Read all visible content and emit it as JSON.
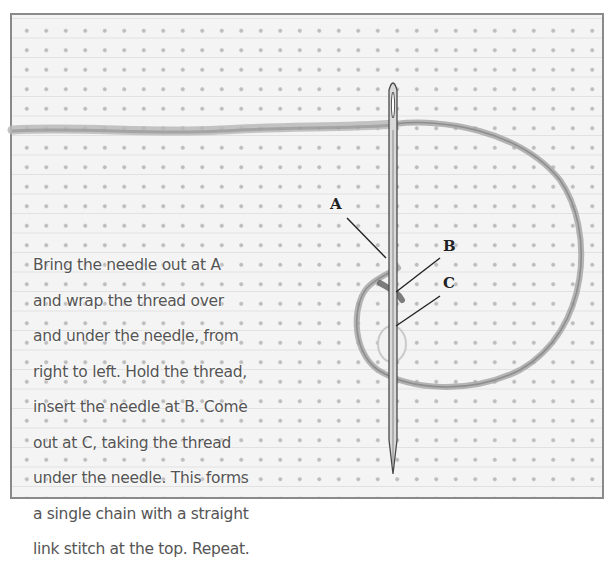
{
  "diagram": {
    "type": "embroidery-stitch-instruction",
    "instructions": {
      "lines": [
        "Bring the needle out at A",
        "and wrap the thread over",
        "and under the needle, from",
        "right to left. Hold the thread,",
        "insert the needle at B. Come",
        "out at C, taking the thread",
        "under the needle. This forms",
        "a single chain with a straight",
        "link stitch at the top. Repeat."
      ]
    },
    "labels": {
      "a": "A",
      "b": "B",
      "c": "C"
    },
    "colors": {
      "frame_border": "#8a8a8a",
      "fabric": "#f4f4f4",
      "fabric_dots": "#bdbdbd",
      "thread": "#9a9a9a",
      "needle": "#5a5a5a",
      "text": "#555555",
      "leader_lines": "#222222"
    }
  }
}
